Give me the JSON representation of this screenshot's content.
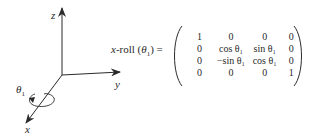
{
  "axes": {
    "z_label": "z",
    "y_label": "y",
    "x_label": "x",
    "rotation_label": "θ",
    "rotation_subscript": "1"
  },
  "equation": {
    "lhs_prefix": "x",
    "lhs_name": "-roll (",
    "lhs_theta": "θ",
    "lhs_sub": "1",
    "lhs_suffix": ") ="
  },
  "matrix": {
    "rows": [
      [
        "1",
        "0",
        "0",
        "0"
      ],
      [
        "0",
        "cos θ₁",
        "sin θ₁",
        "0"
      ],
      [
        "0",
        "−sin θ₁",
        "cos θ₁",
        "0"
      ],
      [
        "0",
        "0",
        "0",
        "1"
      ]
    ]
  },
  "colors": {
    "ink": "#2a2a2a",
    "background": "#ffffff"
  }
}
